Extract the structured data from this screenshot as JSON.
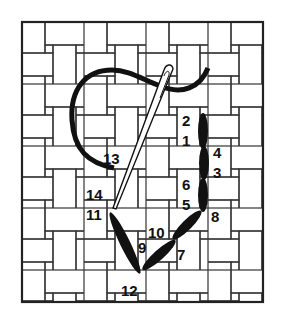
{
  "diagram": {
    "colors": {
      "background": "#ffffff",
      "grid_line": "#333333",
      "thread": "#111111",
      "needle_outline": "#111111",
      "needle_fill": "#ffffff"
    },
    "frame": {
      "x": 22,
      "y": 22,
      "width": 241,
      "height": 280
    },
    "labels": [
      {
        "id": "1",
        "text": "1",
        "x": 182,
        "y": 146
      },
      {
        "id": "2",
        "text": "2",
        "x": 182,
        "y": 126
      },
      {
        "id": "3",
        "text": "3",
        "x": 213,
        "y": 178
      },
      {
        "id": "4",
        "text": "4",
        "x": 213,
        "y": 158
      },
      {
        "id": "5",
        "text": "5",
        "x": 182,
        "y": 210
      },
      {
        "id": "6",
        "text": "6",
        "x": 182,
        "y": 190
      },
      {
        "id": "7",
        "text": "7",
        "x": 177,
        "y": 260
      },
      {
        "id": "8",
        "text": "8",
        "x": 211,
        "y": 222
      },
      {
        "id": "9",
        "text": "9",
        "x": 138,
        "y": 253
      },
      {
        "id": "10",
        "text": "10",
        "x": 148,
        "y": 238
      },
      {
        "id": "11",
        "text": "11",
        "x": 86,
        "y": 220
      },
      {
        "id": "12",
        "text": "12",
        "x": 121,
        "y": 296
      },
      {
        "id": "13",
        "text": "13",
        "x": 103,
        "y": 164
      },
      {
        "id": "14",
        "text": "14",
        "x": 86,
        "y": 200
      }
    ]
  }
}
